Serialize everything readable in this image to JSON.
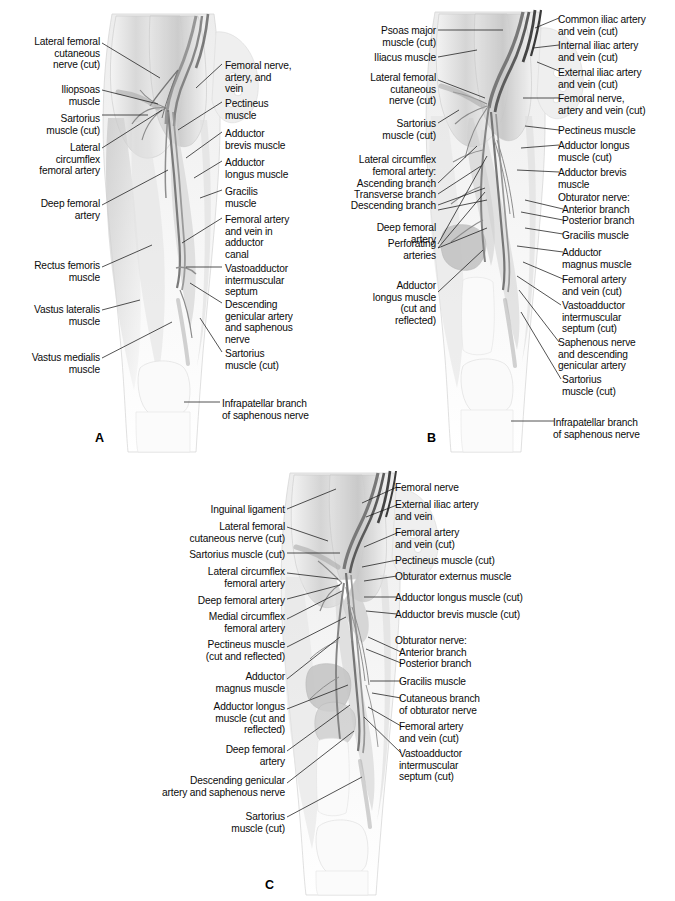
{
  "plate": {
    "width": 675,
    "height": 901,
    "background": "#ffffff",
    "ink": "#1a1a1a"
  },
  "panels": [
    {
      "id": "A",
      "letter": "A",
      "letter_pos": {
        "x": 95,
        "y": 431
      },
      "labels_left": [
        {
          "text": "Lateral femoral\ncutaneous\nnerve (cut)",
          "x": 8,
          "y": 36,
          "w": 92,
          "align": "right"
        },
        {
          "text": "Iliopsoas\nmuscle",
          "x": 18,
          "y": 84,
          "w": 82,
          "align": "right"
        },
        {
          "text": "Sartorius\nmuscle (cut)",
          "x": 8,
          "y": 113,
          "w": 92,
          "align": "right"
        },
        {
          "text": "Lateral\ncircumflex\nfemoral artery",
          "x": 3,
          "y": 142,
          "w": 97,
          "align": "right"
        },
        {
          "text": "Deep femoral\nartery",
          "x": 15,
          "y": 198,
          "w": 85,
          "align": "right"
        },
        {
          "text": "Rectus femoris\nmuscle",
          "x": 8,
          "y": 260,
          "w": 92,
          "align": "right"
        },
        {
          "text": "Vastus lateralis\nmuscle",
          "x": 3,
          "y": 304,
          "w": 97,
          "align": "right"
        },
        {
          "text": "Vastus medialis\nmuscle",
          "x": 3,
          "y": 352,
          "w": 97,
          "align": "right"
        }
      ],
      "labels_right": [
        {
          "text": "Femoral nerve,\nartery, and\nvein",
          "x": 225,
          "y": 60,
          "w": 112,
          "align": "left"
        },
        {
          "text": "Pectineus\nmuscle",
          "x": 225,
          "y": 98,
          "w": 112,
          "align": "left"
        },
        {
          "text": "Adductor\nbrevis muscle",
          "x": 225,
          "y": 128,
          "w": 112,
          "align": "left"
        },
        {
          "text": "Adductor\nlongus muscle",
          "x": 225,
          "y": 157,
          "w": 112,
          "align": "left"
        },
        {
          "text": "Gracilis\nmuscle",
          "x": 225,
          "y": 186,
          "w": 112,
          "align": "left"
        },
        {
          "text": "Femoral artery\nand vein in\nadductor\ncanal",
          "x": 225,
          "y": 214,
          "w": 112,
          "align": "left"
        },
        {
          "text": "Vastoadductor\nintermuscular\nseptum",
          "x": 225,
          "y": 263,
          "w": 112,
          "align": "left"
        },
        {
          "text": "Descending\ngenicular artery\nand saphenous\nnerve",
          "x": 225,
          "y": 299,
          "w": 112,
          "align": "left"
        },
        {
          "text": "Sartorius\nmuscle (cut)",
          "x": 225,
          "y": 348,
          "w": 112,
          "align": "left"
        },
        {
          "text": "Infrapatellar branch\nof saphenous nerve",
          "x": 222,
          "y": 398,
          "w": 118,
          "align": "left"
        }
      ]
    },
    {
      "id": "B",
      "letter": "B",
      "letter_pos": {
        "x": 427,
        "y": 431
      },
      "labels_left": [
        {
          "text": "Psoas major\nmuscle (cut)",
          "x": 341,
          "y": 25,
          "w": 95,
          "align": "right"
        },
        {
          "text": "Iliacus muscle",
          "x": 331,
          "y": 52,
          "w": 105,
          "align": "right"
        },
        {
          "text": "Lateral femoral\ncutaneous\nnerve (cut)",
          "x": 341,
          "y": 72,
          "w": 95,
          "align": "right"
        },
        {
          "text": "Sartorius\nmuscle (cut)",
          "x": 341,
          "y": 118,
          "w": 95,
          "align": "right"
        },
        {
          "text": "Lateral circumflex\nfemoral artery:",
          "x": 325,
          "y": 154,
          "w": 111,
          "align": "right"
        },
        {
          "text": "Ascending branch",
          "x": 325,
          "y": 178,
          "w": 111,
          "align": "right"
        },
        {
          "text": "Transverse branch",
          "x": 325,
          "y": 189,
          "w": 111,
          "align": "right"
        },
        {
          "text": "Descending branch",
          "x": 325,
          "y": 200,
          "w": 111,
          "align": "right"
        },
        {
          "text": "Deep femoral\nartery",
          "x": 341,
          "y": 203,
          "w": 95,
          "align": "right"
        },
        {
          "text": "Perforating\narteries",
          "x": 341,
          "y": 240,
          "w": 95,
          "align": "right"
        },
        {
          "text": "Adductor\nlongus muscle\n(cut and\nreflected)",
          "x": 330,
          "y": 280,
          "w": 106,
          "align": "right"
        }
      ],
      "labels_right": [
        {
          "text": "Common iliac artery\nand vein (cut)",
          "x": 558,
          "y": 14,
          "w": 117,
          "align": "left"
        },
        {
          "text": "Internal iliac artery\nand vein (cut)",
          "x": 558,
          "y": 40,
          "w": 117,
          "align": "left"
        },
        {
          "text": "External iliac artery\nand vein (cut)",
          "x": 558,
          "y": 67,
          "w": 117,
          "align": "left"
        },
        {
          "text": "Femoral nerve,\nartery and vein (cut)",
          "x": 558,
          "y": 93,
          "w": 117,
          "align": "left"
        },
        {
          "text": "Pectineus muscle",
          "x": 558,
          "y": 125,
          "w": 117,
          "align": "left"
        },
        {
          "text": "Adductor longus\nmuscle (cut)",
          "x": 558,
          "y": 140,
          "w": 117,
          "align": "left"
        },
        {
          "text": "Adductor brevis\nmuscle",
          "x": 558,
          "y": 167,
          "w": 117,
          "align": "left"
        },
        {
          "text": "Obturator nerve:",
          "x": 558,
          "y": 192,
          "w": 117,
          "align": "left"
        },
        {
          "text": "Anterior branch",
          "x": 562,
          "y": 204,
          "w": 113,
          "align": "left"
        },
        {
          "text": "Posterior branch",
          "x": 562,
          "y": 215,
          "w": 113,
          "align": "left"
        },
        {
          "text": "Gracilis muscle",
          "x": 562,
          "y": 230,
          "w": 113,
          "align": "left"
        },
        {
          "text": "Adductor\nmagnus muscle",
          "x": 562,
          "y": 247,
          "w": 113,
          "align": "left"
        },
        {
          "text": "Femoral artery\nand vein (cut)",
          "x": 562,
          "y": 274,
          "w": 113,
          "align": "left"
        },
        {
          "text": "Vastoadductor\nintermuscular\nseptum (cut)",
          "x": 562,
          "y": 300,
          "w": 113,
          "align": "left"
        },
        {
          "text": "Saphenous nerve\nand descending\ngenicular artery",
          "x": 558,
          "y": 337,
          "w": 117,
          "align": "left"
        },
        {
          "text": "Sartorius\nmuscle (cut)",
          "x": 562,
          "y": 374,
          "w": 113,
          "align": "left"
        },
        {
          "text": "Infrapatellar branch\nof saphenous nerve",
          "x": 553,
          "y": 417,
          "w": 122,
          "align": "left"
        }
      ]
    },
    {
      "id": "C",
      "letter": "C",
      "letter_pos": {
        "x": 265,
        "y": 878
      },
      "labels_left": [
        {
          "text": "Inguinal ligament",
          "x": 160,
          "y": 504,
          "w": 125,
          "align": "right"
        },
        {
          "text": "Lateral femoral\ncutaneous nerve (cut)",
          "x": 140,
          "y": 521,
          "w": 145,
          "align": "right"
        },
        {
          "text": "Sartorius muscle (cut)",
          "x": 140,
          "y": 549,
          "w": 145,
          "align": "right"
        },
        {
          "text": "Lateral circumflex\nfemoral artery",
          "x": 150,
          "y": 566,
          "w": 135,
          "align": "right"
        },
        {
          "text": "Deep femoral artery",
          "x": 150,
          "y": 595,
          "w": 135,
          "align": "right"
        },
        {
          "text": "Medial circumflex\nfemoral artery",
          "x": 150,
          "y": 611,
          "w": 135,
          "align": "right"
        },
        {
          "text": "Pectineus muscle\n(cut and reflected)",
          "x": 145,
          "y": 639,
          "w": 140,
          "align": "right"
        },
        {
          "text": "Adductor\nmagnus muscle",
          "x": 155,
          "y": 671,
          "w": 130,
          "align": "right"
        },
        {
          "text": "Adductor longus\nmuscle (cut and\nreflected)",
          "x": 150,
          "y": 701,
          "w": 135,
          "align": "right"
        },
        {
          "text": "Deep femoral\nartery",
          "x": 155,
          "y": 744,
          "w": 130,
          "align": "right"
        },
        {
          "text": "Descending genicular\nartery and saphenous nerve",
          "x": 118,
          "y": 775,
          "w": 167,
          "align": "right"
        },
        {
          "text": "Sartorius\nmuscle (cut)",
          "x": 155,
          "y": 811,
          "w": 130,
          "align": "right"
        }
      ],
      "labels_right": [
        {
          "text": "Femoral nerve",
          "x": 395,
          "y": 482,
          "w": 150,
          "align": "left"
        },
        {
          "text": "External iliac artery\nand vein",
          "x": 395,
          "y": 499,
          "w": 150,
          "align": "left"
        },
        {
          "text": "Femoral artery\nand vein (cut)",
          "x": 395,
          "y": 527,
          "w": 150,
          "align": "left"
        },
        {
          "text": "Pectineus muscle (cut)",
          "x": 395,
          "y": 555,
          "w": 150,
          "align": "left"
        },
        {
          "text": "Obturator externus muscle",
          "x": 395,
          "y": 571,
          "w": 160,
          "align": "left"
        },
        {
          "text": "Adductor longus muscle (cut)",
          "x": 395,
          "y": 592,
          "w": 170,
          "align": "left"
        },
        {
          "text": "Adductor brevis muscle (cut)",
          "x": 395,
          "y": 609,
          "w": 170,
          "align": "left"
        },
        {
          "text": "Obturator nerve:",
          "x": 395,
          "y": 635,
          "w": 150,
          "align": "left"
        },
        {
          "text": "Anterior branch",
          "x": 399,
          "y": 647,
          "w": 146,
          "align": "left"
        },
        {
          "text": "Posterior branch",
          "x": 399,
          "y": 658,
          "w": 146,
          "align": "left"
        },
        {
          "text": "Gracilis muscle",
          "x": 399,
          "y": 676,
          "w": 146,
          "align": "left"
        },
        {
          "text": "Cutaneous branch\nof obturator nerve",
          "x": 399,
          "y": 693,
          "w": 146,
          "align": "left"
        },
        {
          "text": "Femoral artery\nand vein (cut)",
          "x": 399,
          "y": 721,
          "w": 146,
          "align": "left"
        },
        {
          "text": "Vastoadductor\nintermuscular\nseptum (cut)",
          "x": 399,
          "y": 748,
          "w": 146,
          "align": "left"
        }
      ]
    }
  ]
}
